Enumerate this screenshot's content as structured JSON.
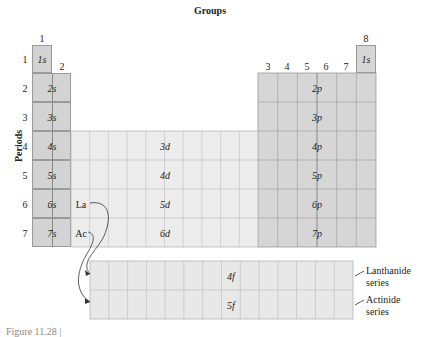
{
  "title": "Groups",
  "axis_label_periods": "Periods",
  "group_labels": [
    "1",
    "2",
    "3",
    "4",
    "5",
    "6",
    "7",
    "8"
  ],
  "period_labels": [
    "1",
    "2",
    "3",
    "4",
    "5",
    "6",
    "7"
  ],
  "blocks": {
    "s": [
      "1s",
      "2s",
      "3s",
      "4s",
      "5s",
      "6s",
      "7s"
    ],
    "p": [
      "2p",
      "3p",
      "4p",
      "5p",
      "6p",
      "7p"
    ],
    "d": [
      "3d",
      "4d",
      "5d",
      "6d"
    ],
    "f": [
      "4f",
      "5f"
    ],
    "helium": "1s"
  },
  "elements": {
    "la": "La",
    "ac": "Ac"
  },
  "series": {
    "lanthanide": [
      "Lanthanide",
      "series"
    ],
    "actinide": [
      "Actinide",
      "series"
    ]
  },
  "caption": "Figure 11.28 |",
  "colors": {
    "s_block": "#d3d3d3",
    "p_block": "#d6d6d6",
    "d_block": "#ececec",
    "f_block": "#e8e8e8",
    "grid": "#9a9a9a"
  }
}
